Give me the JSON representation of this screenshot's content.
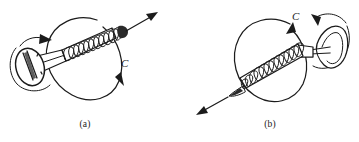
{
  "figure": {
    "background_color": "#ffffff",
    "ink_color": "#1b1b1b",
    "width": 359,
    "height": 142,
    "panels": [
      {
        "id": "a",
        "caption": "(a)",
        "rotation_label": "C",
        "rotation_sense": "counterclockwise-viewed-from-head",
        "head_side": "left",
        "advance_direction": "up-right",
        "thread_turns": 11,
        "elements": {
          "screw_head": "slotted flat countersunk head",
          "rotation_circle": "large ellipse around shaft",
          "advance_arrow": "straight arrow pointing up-right from screw tip",
          "head_arrow": "small curved arrow around head showing turning sense"
        }
      },
      {
        "id": "b",
        "caption": "(b)",
        "rotation_label": "C",
        "rotation_sense": "clockwise-viewed-from-head",
        "head_side": "right",
        "advance_direction": "down-left",
        "thread_turns": 12,
        "elements": {
          "screw_head": "slotted flat countersunk head",
          "rotation_circle": "large ellipse around shaft",
          "advance_arrow": "straight arrow pointing down-left from screw tip",
          "head_arrow": "small curved arrow around head showing turning sense"
        }
      }
    ]
  }
}
